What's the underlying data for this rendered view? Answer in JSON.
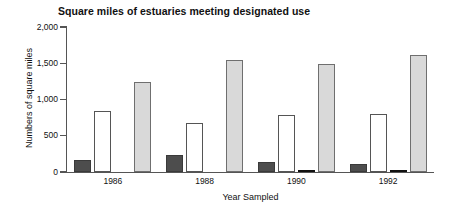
{
  "chart_data": {
    "type": "bar",
    "title": "Square miles of estuaries meeting designated use",
    "xlabel": "Year Sampled",
    "ylabel": "Numbers of square miles",
    "categories": [
      "1986",
      "1988",
      "1990",
      "1992"
    ],
    "ylim": [
      0,
      2000
    ],
    "yticks": [
      0,
      500,
      1000,
      1500,
      2000
    ],
    "ytick_labels": [
      "0",
      "500",
      "1,000",
      "1,500",
      "2,000"
    ],
    "grid": false,
    "legend": "none",
    "series": [
      {
        "name": "dark-gray-series",
        "color": "#4d4d4d",
        "values": [
          160,
          235,
          145,
          105
        ]
      },
      {
        "name": "white-series",
        "color": "#ffffff",
        "values": [
          835,
          670,
          780,
          795
        ]
      },
      {
        "name": "black-series",
        "color": "#111111",
        "values": [
          0,
          0,
          18,
          22
        ]
      },
      {
        "name": "light-gray-series",
        "color": "#d9d9d9",
        "values": [
          1245,
          1540,
          1490,
          1610
        ]
      }
    ]
  },
  "axis_colors": {
    "axis_line": "#555555",
    "text": "#111111",
    "background": "#ffffff"
  }
}
